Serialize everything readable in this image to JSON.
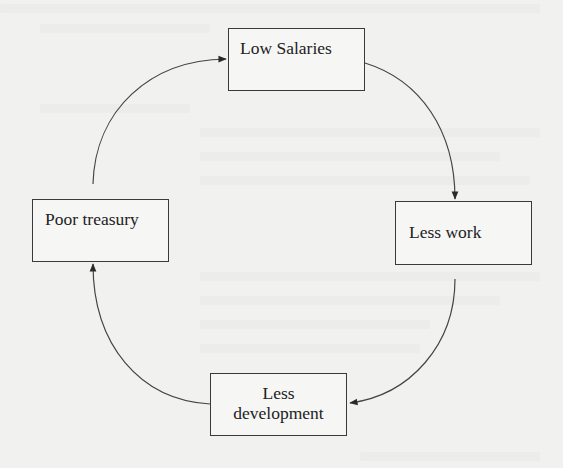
{
  "diagram": {
    "type": "cycle",
    "nodes": [
      {
        "id": "low-salaries",
        "label": "Low Salaries"
      },
      {
        "id": "less-work",
        "label": "Less work"
      },
      {
        "id": "less-development",
        "label_lines": [
          "Less",
          "development"
        ]
      },
      {
        "id": "poor-treasury",
        "label": "Poor treasury"
      }
    ],
    "edges": [
      {
        "from": "low-salaries",
        "to": "less-work"
      },
      {
        "from": "less-work",
        "to": "less-development"
      },
      {
        "from": "less-development",
        "to": "poor-treasury"
      },
      {
        "from": "poor-treasury",
        "to": "low-salaries"
      }
    ],
    "colors": {
      "background": "#f1f1f0",
      "stroke": "#3a3a3a",
      "text": "#222222"
    }
  }
}
